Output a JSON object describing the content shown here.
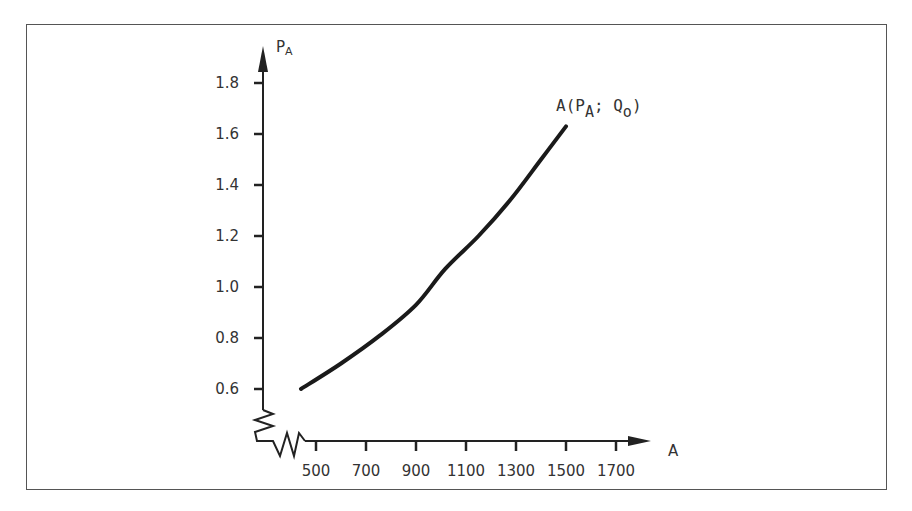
{
  "chart_data": {
    "type": "line",
    "title": "",
    "xlabel": "A",
    "ylabel": "P_A",
    "xlim": [
      400,
      1750
    ],
    "ylim": [
      0.6,
      1.9
    ],
    "x_ticks": [
      500,
      700,
      900,
      1100,
      1300,
      1500,
      1700
    ],
    "x_tick_labels": [
      "500",
      "700",
      "900",
      "1100",
      "1300",
      "1500",
      "1700"
    ],
    "y_ticks": [
      0.6,
      0.8,
      1.0,
      1.2,
      1.4,
      1.6,
      1.8
    ],
    "y_tick_labels": [
      "0.6",
      "0.8",
      "1.0",
      "1.2",
      "1.4",
      "1.6",
      "1.8"
    ],
    "axis_breaks": {
      "x": true,
      "y": true
    },
    "grid": false,
    "legend": null,
    "series": [
      {
        "name": "A(P_A; Q_o)",
        "x": [
          440,
          600,
          756,
          900,
          1016,
          1150,
          1276,
          1400,
          1500
        ],
        "y": [
          0.6,
          0.7,
          0.81,
          0.93,
          1.07,
          1.2,
          1.34,
          1.5,
          1.63
        ]
      }
    ],
    "annotations": [
      {
        "text": "A(P_A; Q_o)",
        "x": 1500,
        "y": 1.68
      }
    ]
  },
  "labels": {
    "y_axis_main": "P",
    "y_axis_sub": "A",
    "x_axis": "A",
    "curve_label_prefix": "A(P",
    "curve_label_sub1": "A",
    "curve_label_mid": "; Q",
    "curve_label_sub2": "o",
    "curve_label_suffix": ")"
  }
}
